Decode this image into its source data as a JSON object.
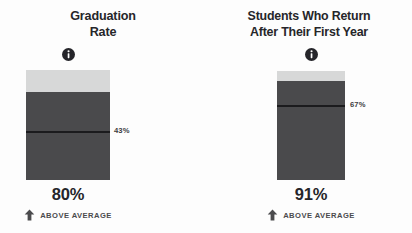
{
  "page": {
    "background_color": "#fdfdfd",
    "text_color": "#26262a"
  },
  "colors": {
    "bar_fill": "#4a4a4c",
    "bar_track": "#d7d8d8",
    "benchmark_line": "#1b1b1d",
    "value_text": "#25252a"
  },
  "cards": [
    {
      "id": "graduation",
      "title_lines": [
        "Graduation",
        "Rate"
      ],
      "info_icon": "info-icon",
      "value": "80%",
      "benchmark_label": "43%",
      "comparison_text": "ABOVE AVERAGE",
      "comparison_icon": "arrow-up-icon"
    },
    {
      "id": "retention",
      "title_lines": [
        "Students Who Return",
        "After Their First Year"
      ],
      "info_icon": "info-icon",
      "value": "91%",
      "benchmark_label": "67%",
      "comparison_text": "ABOVE AVERAGE",
      "comparison_icon": "arrow-up-icon"
    }
  ],
  "chart_data": [
    {
      "type": "bar",
      "title": "Graduation Rate",
      "categories": [
        "Graduation Rate"
      ],
      "values": [
        80
      ],
      "benchmark": 43,
      "benchmark_label": "43%",
      "value_label": "80%",
      "comparison": "ABOVE AVERAGE",
      "ylim": [
        0,
        100
      ],
      "ylabel": "",
      "xlabel": "",
      "grid": false,
      "legend": "none",
      "orientation": "vertical",
      "annotations": [
        "43%",
        "80%",
        "ABOVE AVERAGE"
      ]
    },
    {
      "type": "bar",
      "title": "Students Who Return After Their First Year",
      "categories": [
        "Students Who Return After Their First Year"
      ],
      "values": [
        91
      ],
      "benchmark": 67,
      "benchmark_label": "67%",
      "value_label": "91%",
      "comparison": "ABOVE AVERAGE",
      "ylim": [
        0,
        100
      ],
      "ylabel": "",
      "xlabel": "",
      "grid": false,
      "legend": "none",
      "orientation": "vertical",
      "annotations": [
        "67%",
        "91%",
        "ABOVE AVERAGE"
      ]
    }
  ]
}
